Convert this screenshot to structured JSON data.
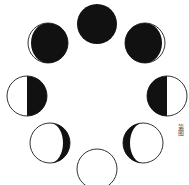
{
  "diagram": {
    "colors": {
      "dark": "#111111",
      "light": "#ffffff",
      "outline": "#333333"
    },
    "phases": [
      {
        "name": "new-moon",
        "cx": 97,
        "cy": 24,
        "r": 20,
        "lit": "none"
      },
      {
        "name": "waxing-crescent",
        "cx": 145,
        "cy": 43,
        "r": 20,
        "lit": "right-thin"
      },
      {
        "name": "first-quarter",
        "cx": 167,
        "cy": 96,
        "r": 20,
        "lit": "right-half"
      },
      {
        "name": "waxing-gibbous",
        "cx": 143,
        "cy": 143,
        "r": 20,
        "lit": "right-gibbous"
      },
      {
        "name": "full-moon",
        "cx": 97,
        "cy": 169,
        "r": 20,
        "lit": "full"
      },
      {
        "name": "waning-gibbous",
        "cx": 50,
        "cy": 143,
        "r": 20,
        "lit": "left-gibbous"
      },
      {
        "name": "last-quarter",
        "cx": 27,
        "cy": 96,
        "r": 20,
        "lit": "left-half"
      },
      {
        "name": "waning-crescent",
        "cx": 48,
        "cy": 43,
        "r": 20,
        "lit": "left-thin"
      }
    ]
  },
  "caption": {
    "text": "第图"
  }
}
